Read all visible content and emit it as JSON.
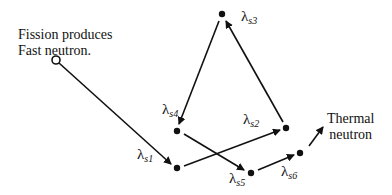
{
  "start_label": {
    "line1": "Fission produces",
    "line2": "Fast neutron."
  },
  "end_label": {
    "line1": "Thermal",
    "line2": "neutron"
  },
  "nodes": [
    {
      "id": "s1",
      "symbol": "λ",
      "sub": "s1",
      "x": 177,
      "y": 168
    },
    {
      "id": "s2",
      "symbol": "λ",
      "sub": "s2",
      "x": 286,
      "y": 128
    },
    {
      "id": "s3",
      "symbol": "λ",
      "sub": "s3",
      "x": 222,
      "y": 14
    },
    {
      "id": "s4",
      "symbol": "λ",
      "sub": "s4",
      "x": 177,
      "y": 131
    },
    {
      "id": "s5",
      "symbol": "λ",
      "sub": "s5",
      "x": 251,
      "y": 173
    },
    {
      "id": "s6",
      "symbol": "λ",
      "sub": "s6",
      "x": 300,
      "y": 153
    }
  ],
  "edges": [
    {
      "from": "start",
      "to": "s1"
    },
    {
      "from": "s1",
      "to": "s2"
    },
    {
      "from": "s2",
      "to": "s3"
    },
    {
      "from": "s3",
      "to": "s4"
    },
    {
      "from": "s4",
      "to": "s5"
    },
    {
      "from": "s5",
      "to": "s6"
    },
    {
      "from": "s6",
      "to": "end"
    }
  ],
  "colors": {
    "ink": "#111111",
    "background": "#ffffff"
  }
}
